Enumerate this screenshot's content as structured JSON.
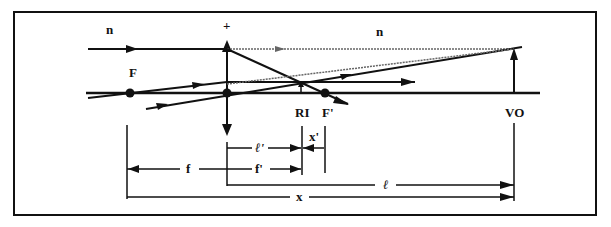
{
  "diagram": {
    "type": "thin-lens-ray-diagram",
    "colors": {
      "ink": "#111111",
      "dotted": "#555555",
      "background": "#ffffff"
    },
    "labels": {
      "medium_left": "n",
      "medium_right": "n",
      "lens_sign": "+",
      "front_focus": "F",
      "back_focus": "F'",
      "real_image": "RI",
      "virtual_object": "VO"
    },
    "dimensions": {
      "image_distance": "ℓ'",
      "back_focal_length": "f'",
      "front_focal_length": "f",
      "image_from_focus": "x'",
      "object_distance": "ℓ",
      "object_from_focus": "x"
    }
  }
}
